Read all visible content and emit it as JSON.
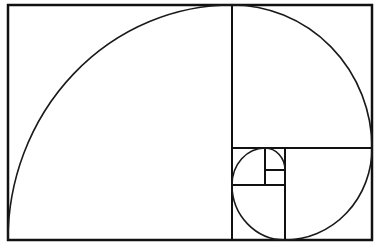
{
  "diagram": {
    "colors": {
      "background": "#ffffff",
      "stroke": "#111111"
    },
    "frame": {
      "x1": 8,
      "y1": 5,
      "x2": 372,
      "y2": 240
    },
    "dividers": [
      {
        "id": "v1",
        "x1": 232,
        "y1": 5,
        "x2": 232,
        "y2": 240
      },
      {
        "id": "h1",
        "x1": 232,
        "y1": 148,
        "x2": 372,
        "y2": 148
      },
      {
        "id": "v2",
        "x1": 285,
        "y1": 148,
        "x2": 285,
        "y2": 240
      },
      {
        "id": "h2",
        "x1": 232,
        "y1": 185,
        "x2": 285,
        "y2": 185
      },
      {
        "id": "v3",
        "x1": 265,
        "y1": 148,
        "x2": 265,
        "y2": 185
      },
      {
        "id": "h3",
        "x1": 265,
        "y1": 170,
        "x2": 285,
        "y2": 170
      }
    ],
    "squares": [
      {
        "id": "sq1",
        "x": 8,
        "y": 5,
        "w": 224,
        "h": 235
      },
      {
        "id": "sq2",
        "x": 232,
        "y": 5,
        "w": 140,
        "h": 143
      },
      {
        "id": "sq3",
        "x": 285,
        "y": 148,
        "w": 87,
        "h": 92
      },
      {
        "id": "sq4",
        "x": 232,
        "y": 185,
        "w": 53,
        "h": 55
      },
      {
        "id": "sq5",
        "x": 232,
        "y": 148,
        "w": 33,
        "h": 37
      },
      {
        "id": "sq6",
        "x": 265,
        "y": 148,
        "w": 20,
        "h": 22
      },
      {
        "id": "sq7",
        "x": 265,
        "y": 170,
        "w": 20,
        "h": 15
      }
    ]
  }
}
